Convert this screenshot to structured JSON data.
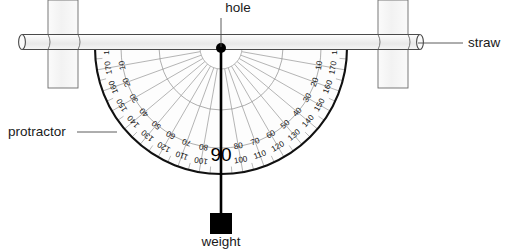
{
  "figure": {
    "background_color": "#ffffff"
  },
  "callouts": [
    {
      "key": "hole",
      "label": "hole",
      "x": 238,
      "y": 12,
      "anchor": "middle",
      "leader": {
        "x1": 221,
        "y1": 18,
        "x2": 221,
        "y2": 47
      }
    },
    {
      "key": "straw",
      "label": "straw",
      "x": 468,
      "y": 47,
      "anchor": "start",
      "leader": {
        "x1": 418,
        "y1": 43,
        "x2": 463,
        "y2": 43
      }
    },
    {
      "key": "protractor",
      "label": "protractor",
      "x": 8,
      "y": 136,
      "anchor": "start",
      "leader": {
        "x1": 77,
        "y1": 132,
        "x2": 117,
        "y2": 132
      }
    },
    {
      "key": "weight",
      "label": "weight",
      "x": 221,
      "y": 246,
      "anchor": "middle",
      "leader": null
    }
  ],
  "protractor": {
    "center": {
      "x": 221,
      "y": 48
    },
    "outer_radius": 126,
    "mid_radius": 100,
    "inner_radius": 62,
    "hub_radius": 21,
    "face_color": "#fdfdfd",
    "rim_color": "#111111",
    "grid_color": "#8d8d8d",
    "center_reading": "90",
    "scale_labels": [
      {
        "outer": "180",
        "inner": "0",
        "angle": 180
      },
      {
        "outer": "170",
        "inner": "10",
        "angle": 170
      },
      {
        "outer": "160",
        "inner": "20",
        "angle": 160
      },
      {
        "outer": "150",
        "inner": "30",
        "angle": 150
      },
      {
        "outer": "140",
        "inner": "40",
        "angle": 140
      },
      {
        "outer": "130",
        "inner": "50",
        "angle": 130
      },
      {
        "outer": "120",
        "inner": "60",
        "angle": 120
      },
      {
        "outer": "110",
        "inner": "70",
        "angle": 110
      },
      {
        "outer": "100",
        "inner": "80",
        "angle": 100
      },
      {
        "outer": "100",
        "inner": "80",
        "angle": 80
      },
      {
        "outer": "110",
        "inner": "70",
        "angle": 70
      },
      {
        "outer": "120",
        "inner": "60",
        "angle": 60
      },
      {
        "outer": "130",
        "inner": "50",
        "angle": 50
      },
      {
        "outer": "140",
        "inner": "40",
        "angle": 40
      },
      {
        "outer": "150",
        "inner": "30",
        "angle": 30
      },
      {
        "outer": "160",
        "inner": "20",
        "angle": 20
      },
      {
        "outer": "170",
        "inner": "10",
        "angle": 10
      },
      {
        "outer": "180",
        "inner": "0",
        "angle": 0
      }
    ],
    "tick_interval_degrees": 10
  },
  "straw": {
    "x1": 22,
    "x2": 420,
    "y": 42,
    "thickness": 15,
    "body_color": "#f2f2f2",
    "edge_color": "#4a4a4a"
  },
  "posts": [
    {
      "key": "post-left",
      "x": 48,
      "y": 0,
      "width": 30,
      "height": 88,
      "fill": "#f7f7f7",
      "stroke": "#6b6b6b"
    },
    {
      "key": "post-right",
      "x": 378,
      "y": 0,
      "width": 30,
      "height": 88,
      "fill": "#f7f7f7",
      "stroke": "#6b6b6b"
    }
  ],
  "plumb_line": {
    "x": 221,
    "y_top": 48,
    "y_bottom": 213,
    "color": "#000000",
    "width": 2.6
  },
  "pivot": {
    "x": 221,
    "y": 48,
    "radius": 5,
    "color": "#000000"
  },
  "weight_block": {
    "x": 210,
    "y": 213,
    "width": 22,
    "height": 21,
    "color": "#000000"
  }
}
